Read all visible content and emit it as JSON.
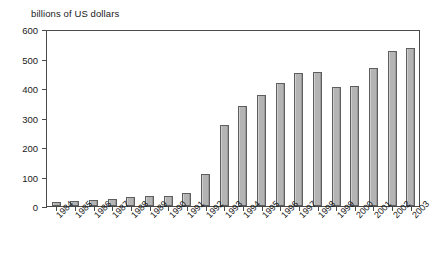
{
  "chart_data": {
    "type": "bar",
    "title": "",
    "subtitle": "",
    "ylabel": "billions of US dollars",
    "xlabel": "",
    "ylim": [
      0,
      600
    ],
    "yticks": [
      0,
      100,
      200,
      300,
      400,
      500,
      600
    ],
    "grid": false,
    "legend": null,
    "bar_color": "#b4b4b4",
    "bar_border_color": "#5e5e5e",
    "axis_color": "#4a4a4a",
    "categories": [
      "1984",
      "1985",
      "1986",
      "1987",
      "1988",
      "1989",
      "1990",
      "1991",
      "1992",
      "1993",
      "1994",
      "1995",
      "1996",
      "1997",
      "1998",
      "1999",
      "2000",
      "2001",
      "2002",
      "2003"
    ],
    "values": [
      12,
      17,
      19,
      24,
      31,
      33,
      35,
      43,
      110,
      275,
      339,
      376,
      416,
      452,
      454,
      403,
      406,
      468,
      526,
      534
    ],
    "series": [
      {
        "name": "billions of US dollars",
        "values": [
          12,
          17,
          19,
          24,
          31,
          33,
          35,
          43,
          110,
          275,
          339,
          376,
          416,
          452,
          454,
          403,
          406,
          468,
          526,
          534
        ]
      }
    ]
  }
}
